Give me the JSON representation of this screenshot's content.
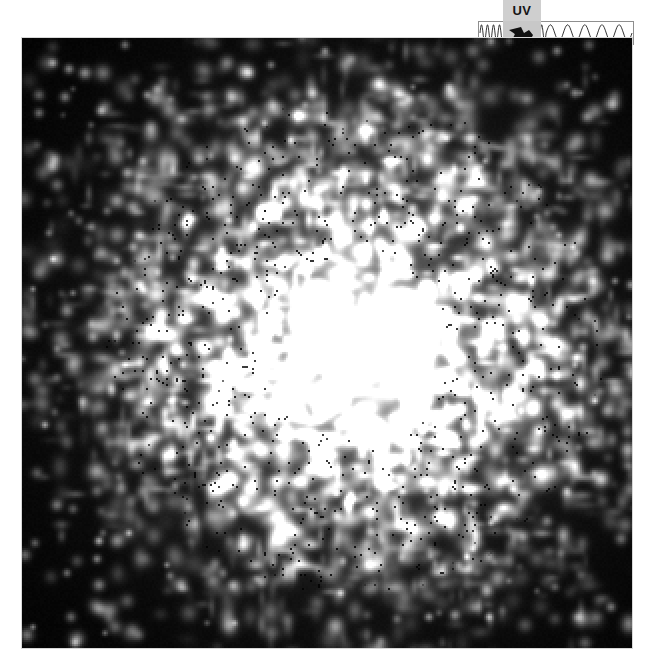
{
  "page": {
    "background_color": "#ffffff",
    "width": 650,
    "height": 664
  },
  "spectrum_indicator": {
    "label": "UV",
    "label_background": "#cfcfcf",
    "label_color": "#151515",
    "strip_background": "#ffffff",
    "strip_border_color": "#8e8e8e",
    "marker_name": "wavelength-position-arrow",
    "marker_color": "#111111",
    "marker_background": "#c8c8c8",
    "description": "Electromagnetic spectrum wavelength strip: short high-frequency waves on the left, long low-frequency waves on the right, with a pointer indicating the ultraviolet band.",
    "wave_left_cycles": 11,
    "wave_right_cycles": 5
  },
  "sky_image": {
    "name": "uv-galaxy-image",
    "background_color": "#000000",
    "band": "UV",
    "target_type": "spiral galaxy",
    "description": "Grayscale ultraviolet image of a galaxy: bright saturated nucleus surrounded by a mottled ring of star-forming knots fading into noisy black sky background.",
    "x": 22,
    "y": 38,
    "width": 610,
    "height": 610,
    "core": {
      "center_x": 0.545,
      "center_y": 0.505,
      "core_radius": 0.052,
      "halo_radius": 0.12,
      "peak_gray": 252
    },
    "disk": {
      "radius": 0.34,
      "knot_count": 2600,
      "mean_knot_gray": 96
    },
    "noise": {
      "pixel_scale": 4,
      "floor_gray": 4,
      "seed": 20240617
    }
  },
  "chart_data": {
    "type": "heatmap",
    "xlabel": "",
    "ylabel": "",
    "colormap": "grayscale",
    "value_range": [
      0,
      255
    ],
    "legend": [
      "UV"
    ],
    "annotations": [
      "UV"
    ]
  }
}
